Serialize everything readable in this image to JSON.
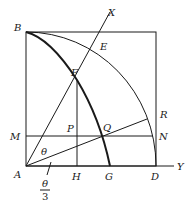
{
  "diagram": {
    "type": "geometric-construction",
    "points": {
      "A": "A",
      "B": "B",
      "D": "D",
      "E": "E",
      "F": "F",
      "G": "G",
      "H": "H",
      "M": "M",
      "N": "N",
      "P": "P",
      "Q": "Q",
      "R": "R",
      "X": "X",
      "Y": "Y"
    },
    "angles": {
      "theta": "θ",
      "theta_over_3_num": "θ",
      "theta_over_3_den": "3"
    },
    "colors": {
      "stroke": "#1a1a1a",
      "background": "#ffffff"
    }
  }
}
